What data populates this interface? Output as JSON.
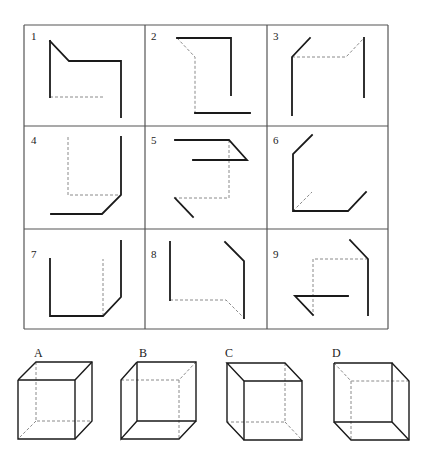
{
  "colors": {
    "line": "#1a1a1a",
    "dashed": "#8a8a8a",
    "grid": "#555555",
    "background": "#ffffff"
  },
  "grid": {
    "x": [
      24,
      145,
      267,
      388
    ],
    "y": [
      25,
      126,
      229,
      329
    ]
  },
  "cells": [
    {
      "label": "1",
      "lx": 31,
      "ly": 40,
      "solid": [
        [
          [
            50,
            41
          ],
          [
            69,
            61
          ],
          [
            121,
            61
          ],
          [
            121,
            117
          ]
        ],
        [
          [
            50,
            41
          ],
          [
            50,
            97
          ]
        ]
      ],
      "dashed": [
        [
          [
            50,
            97
          ],
          [
            104,
            97
          ]
        ]
      ]
    },
    {
      "label": "2",
      "lx": 151,
      "ly": 40,
      "solid": [
        [
          [
            177,
            38
          ],
          [
            231,
            38
          ],
          [
            231,
            95
          ]
        ],
        [
          [
            195,
            113
          ],
          [
            250,
            113
          ]
        ]
      ],
      "dashed": [
        [
          [
            177,
            38
          ],
          [
            195,
            57
          ],
          [
            195,
            113
          ]
        ]
      ]
    },
    {
      "label": "3",
      "lx": 273,
      "ly": 40,
      "solid": [
        [
          [
            310,
            38
          ],
          [
            292,
            57
          ],
          [
            292,
            115
          ]
        ],
        [
          [
            364,
            38
          ],
          [
            364,
            97
          ]
        ]
      ],
      "dashed": [
        [
          [
            292,
            57
          ],
          [
            346,
            57
          ],
          [
            364,
            38
          ]
        ]
      ]
    },
    {
      "label": "4",
      "lx": 31,
      "ly": 144,
      "solid": [
        [
          [
            121,
            137
          ],
          [
            121,
            195
          ],
          [
            102,
            214
          ],
          [
            51,
            214
          ]
        ]
      ],
      "dashed": [
        [
          [
            68,
            137
          ],
          [
            68,
            195
          ],
          [
            121,
            195
          ]
        ]
      ]
    },
    {
      "label": "5",
      "lx": 151,
      "ly": 144,
      "solid": [
        [
          [
            175,
            140
          ],
          [
            229,
            140
          ],
          [
            247,
            160
          ],
          [
            193,
            160
          ]
        ],
        [
          [
            175,
            198
          ],
          [
            193,
            217
          ]
        ]
      ],
      "dashed": [
        [
          [
            229,
            140
          ],
          [
            229,
            198
          ],
          [
            175,
            198
          ]
        ]
      ]
    },
    {
      "label": "6",
      "lx": 273,
      "ly": 144,
      "solid": [
        [
          [
            312,
            135
          ],
          [
            293,
            154
          ],
          [
            293,
            211
          ],
          [
            348,
            211
          ],
          [
            366,
            192
          ]
        ]
      ],
      "dashed": [
        [
          [
            293,
            211
          ],
          [
            312,
            192
          ]
        ]
      ]
    },
    {
      "label": "7",
      "lx": 31,
      "ly": 258,
      "solid": [
        [
          [
            50,
            259
          ],
          [
            50,
            316
          ],
          [
            103,
            316
          ],
          [
            121,
            297
          ],
          [
            121,
            241
          ]
        ]
      ],
      "dashed": [
        [
          [
            103,
            316
          ],
          [
            103,
            259
          ]
        ]
      ]
    },
    {
      "label": "8",
      "lx": 151,
      "ly": 258,
      "solid": [
        [
          [
            170,
            242
          ],
          [
            170,
            300
          ]
        ],
        [
          [
            225,
            242
          ],
          [
            244,
            261
          ],
          [
            244,
            318
          ]
        ]
      ],
      "dashed": [
        [
          [
            170,
            300
          ],
          [
            226,
            300
          ],
          [
            244,
            318
          ]
        ]
      ]
    },
    {
      "label": "9",
      "lx": 273,
      "ly": 258,
      "solid": [
        [
          [
            350,
            240
          ],
          [
            368,
            259
          ],
          [
            368,
            315
          ]
        ],
        [
          [
            348,
            296
          ],
          [
            295,
            296
          ],
          [
            313,
            315
          ]
        ]
      ],
      "dashed": [
        [
          [
            368,
            259
          ],
          [
            313,
            259
          ],
          [
            313,
            315
          ]
        ]
      ]
    }
  ],
  "options": [
    {
      "label": "A",
      "lx": 34,
      "ly": 357,
      "solid": [
        [
          [
            18,
            380
          ],
          [
            75,
            380
          ],
          [
            75,
            439
          ],
          [
            18,
            439
          ],
          [
            18,
            380
          ]
        ],
        [
          [
            18,
            380
          ],
          [
            36,
            362
          ],
          [
            92,
            362
          ],
          [
            92,
            421
          ],
          [
            75,
            439
          ]
        ],
        [
          [
            75,
            380
          ],
          [
            92,
            362
          ]
        ]
      ],
      "dashed": [
        [
          [
            36,
            362
          ],
          [
            36,
            421
          ],
          [
            92,
            421
          ]
        ],
        [
          [
            36,
            421
          ],
          [
            18,
            439
          ]
        ]
      ]
    },
    {
      "label": "B",
      "lx": 139,
      "ly": 357,
      "solid": [
        [
          [
            137,
            362
          ],
          [
            196,
            362
          ],
          [
            196,
            421
          ],
          [
            137,
            421
          ],
          [
            137,
            362
          ]
        ],
        [
          [
            137,
            362
          ],
          [
            121,
            380
          ],
          [
            121,
            439
          ],
          [
            137,
            421
          ]
        ],
        [
          [
            121,
            439
          ],
          [
            179,
            439
          ],
          [
            196,
            421
          ]
        ]
      ],
      "dashed": [
        [
          [
            121,
            380
          ],
          [
            179,
            380
          ],
          [
            196,
            362
          ]
        ],
        [
          [
            179,
            380
          ],
          [
            179,
            439
          ]
        ]
      ]
    },
    {
      "label": "C",
      "lx": 225,
      "ly": 357,
      "solid": [
        [
          [
            244,
            381
          ],
          [
            302,
            381
          ],
          [
            302,
            440
          ],
          [
            244,
            440
          ],
          [
            244,
            381
          ]
        ],
        [
          [
            244,
            381
          ],
          [
            227,
            363
          ],
          [
            285,
            363
          ],
          [
            302,
            381
          ]
        ],
        [
          [
            227,
            363
          ],
          [
            227,
            422
          ],
          [
            244,
            440
          ]
        ]
      ],
      "dashed": [
        [
          [
            285,
            363
          ],
          [
            285,
            422
          ],
          [
            227,
            422
          ]
        ],
        [
          [
            285,
            422
          ],
          [
            302,
            440
          ]
        ]
      ]
    },
    {
      "label": "D",
      "lx": 332,
      "ly": 357,
      "solid": [
        [
          [
            334,
            363
          ],
          [
            392,
            363
          ],
          [
            392,
            422
          ],
          [
            334,
            422
          ],
          [
            334,
            363
          ]
        ],
        [
          [
            392,
            363
          ],
          [
            409,
            381
          ],
          [
            409,
            440
          ],
          [
            351,
            440
          ],
          [
            334,
            422
          ]
        ],
        [
          [
            392,
            422
          ],
          [
            409,
            440
          ]
        ]
      ],
      "dashed": [
        [
          [
            334,
            363
          ],
          [
            351,
            381
          ],
          [
            409,
            381
          ]
        ],
        [
          [
            351,
            381
          ],
          [
            351,
            440
          ]
        ]
      ]
    }
  ]
}
